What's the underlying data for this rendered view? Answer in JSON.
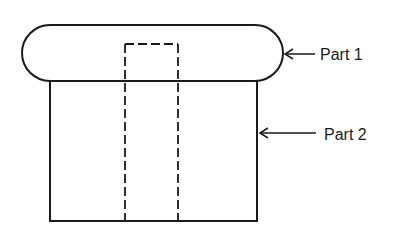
{
  "diagram": {
    "type": "mechanical-assembly-sketch",
    "parts": [
      {
        "id": "part1",
        "label": "Part 1",
        "shape": "rounded-rectangle cap"
      },
      {
        "id": "part2",
        "label": "Part 2",
        "shape": "rectangular body"
      }
    ],
    "hidden_feature": "dashed rectangular bore through center",
    "colors": {
      "line": "#1a1a1a",
      "background": "#ffffff"
    }
  }
}
